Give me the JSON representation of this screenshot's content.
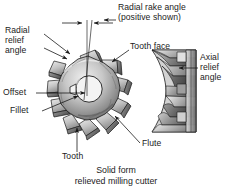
{
  "figure": {
    "title": "Solid form relieved milling cutter",
    "caption_line1": "Solid form",
    "caption_line2": "relieved milling cutter",
    "background_color": "#ffffff",
    "ink_color": "#1b1b1b"
  },
  "labels": {
    "radial_rake_angle_l1": "Radial rake angle",
    "radial_rake_angle_l2": "(positive shown)",
    "radial_relief_l1": "Radial",
    "radial_relief_l2": "relief",
    "radial_relief_l3": "angle",
    "tooth_face": "Tooth face",
    "axial_relief_l1": "Axial",
    "axial_relief_l2": "relief",
    "axial_relief_l3": "angle",
    "offset": "Offset",
    "fillet": "Fillet",
    "tooth": "Tooth",
    "flute": "Flute"
  },
  "drawing": {
    "type": "technical-illustration",
    "subject": "solid form relieved milling cutter",
    "views": [
      "front face view",
      "side profile view"
    ],
    "tooth_count": 10,
    "has_center_bore": true,
    "has_keyway": true,
    "shading_colors": {
      "light": "#e8e8e8",
      "mid": "#b4b4b4",
      "dark": "#6e6e6e",
      "darkest": "#3d3d3d",
      "outline": "#1b1b1b"
    }
  }
}
